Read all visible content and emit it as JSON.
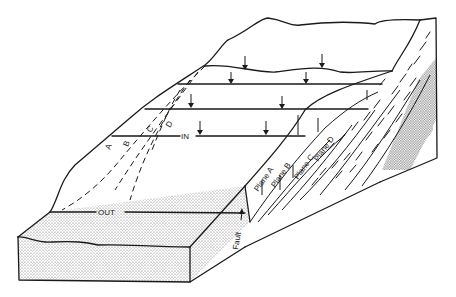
{
  "figure": {
    "type": "block-diagram"
  },
  "labels": {
    "in": "IN",
    "out": "OUT",
    "fault": "Fault",
    "plane_a": "Plane A",
    "plane_b": "Plane B",
    "plane_c": "Plane C",
    "plane_d": "Plane D",
    "trace_a": "A",
    "trace_b": "B",
    "trace_c": "C",
    "trace_d": "D"
  },
  "colors": {
    "line": "#1a1a1a",
    "background": "#ffffff",
    "stipple": "#d8d8d8"
  }
}
